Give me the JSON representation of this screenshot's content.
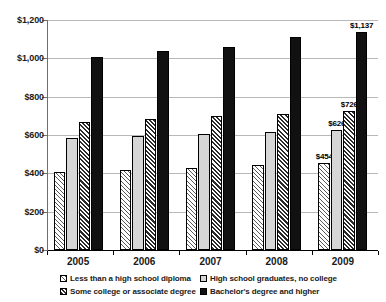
{
  "chart_data": {
    "type": "bar",
    "title": "",
    "subtitle": "",
    "xlabel": "",
    "ylabel": "",
    "categories": [
      "2005",
      "2006",
      "2007",
      "2008",
      "2009"
    ],
    "ylim": [
      0,
      1200
    ],
    "ytick_values": [
      0,
      200,
      400,
      600,
      800,
      1000,
      1200
    ],
    "ytick_labels": [
      "$0",
      "$200",
      "$400",
      "$600",
      "$800",
      "$1,000",
      "$1,200"
    ],
    "grid": true,
    "legend_position": "bottom",
    "series": [
      {
        "name": "Less than a high school diploma",
        "pattern": "diagonal-hatch-light",
        "values": [
          409,
          419,
          428,
          443,
          454
        ],
        "labels": [
          "",
          "",
          "",
          "",
          "$454"
        ]
      },
      {
        "name": "High school graduates, no college",
        "pattern": "solid-light-gray",
        "values": [
          583,
          595,
          604,
          618,
          626
        ],
        "labels": [
          "",
          "",
          "",
          "",
          "$626"
        ]
      },
      {
        "name": "Some college or associate degree",
        "pattern": "diagonal-hatch-dark",
        "values": [
          667,
          683,
          697,
          712,
          726
        ],
        "labels": [
          "",
          "",
          "",
          "",
          "$726"
        ]
      },
      {
        "name": "Bachelor's degree and higher",
        "pattern": "solid-black",
        "values": [
          1008,
          1039,
          1060,
          1110,
          1137
        ],
        "labels": [
          "",
          "",
          "",
          "",
          "$1,137"
        ]
      }
    ]
  },
  "colors": {
    "series_0": "#ffffff",
    "series_1": "#d6d6d6",
    "series_2": "#ffffff",
    "series_3": "#111111",
    "axis": "#6e6e6e",
    "gridline": "#b8b8b8",
    "text": "#1a1a1a",
    "background": "#ffffff"
  }
}
